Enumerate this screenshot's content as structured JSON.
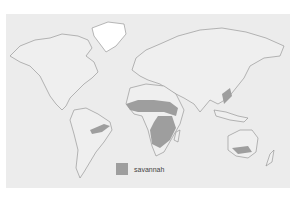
{
  "map": {
    "type": "world-distribution-map",
    "background_color": "#ececec",
    "land_fill": "#efefef",
    "outline_color": "#8a8a8a",
    "regions": [
      {
        "name": "Sahel / Sudan savannah",
        "continent": "Africa"
      },
      {
        "name": "East & Southern African savannah",
        "continent": "Africa"
      },
      {
        "name": "Brazilian cerrado",
        "continent": "South America"
      },
      {
        "name": "Northern Australian savannah",
        "continent": "Australia"
      },
      {
        "name": "South/Southeast Asian savannah",
        "continent": "Asia"
      }
    ]
  },
  "legend": {
    "items": [
      {
        "label": "savannah",
        "color": "#9e9e9e"
      }
    ]
  }
}
